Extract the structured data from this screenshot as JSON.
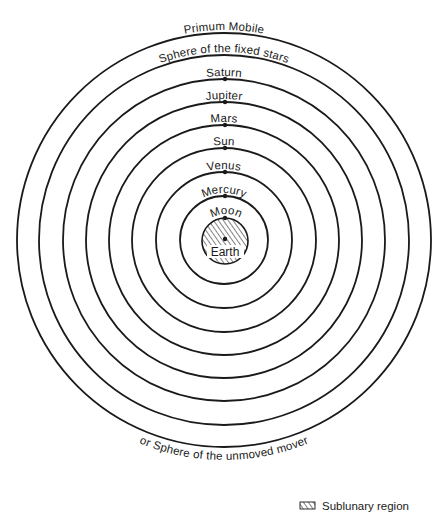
{
  "diagram": {
    "center": {
      "x": 224,
      "y": 240
    },
    "colors": {
      "line": "#1a1a1a",
      "background": "#ffffff"
    },
    "spheres": [
      {
        "label": "Primum Mobile",
        "radius": 207,
        "dot": false
      },
      {
        "label": "Sphere of the fixed stars",
        "radius": 185,
        "dot": false
      },
      {
        "label": "Saturn",
        "radius": 161,
        "dot": true
      },
      {
        "label": "Jupiter",
        "radius": 138,
        "dot": true
      },
      {
        "label": "Mars",
        "radius": 115,
        "dot": true
      },
      {
        "label": "Sun",
        "radius": 92,
        "dot": true
      },
      {
        "label": "Venus",
        "radius": 68,
        "dot": true
      },
      {
        "label": "Mercury",
        "radius": 44,
        "dot": true
      },
      {
        "label": "Moon",
        "radius": 23,
        "dot": true
      }
    ],
    "outer_caption": "or Sphere of the unmoved mover",
    "earth": {
      "label": "Earth",
      "radius": 23,
      "hatched": true
    },
    "legend": {
      "label": "Sublunary region",
      "swatch": "hatched"
    }
  }
}
